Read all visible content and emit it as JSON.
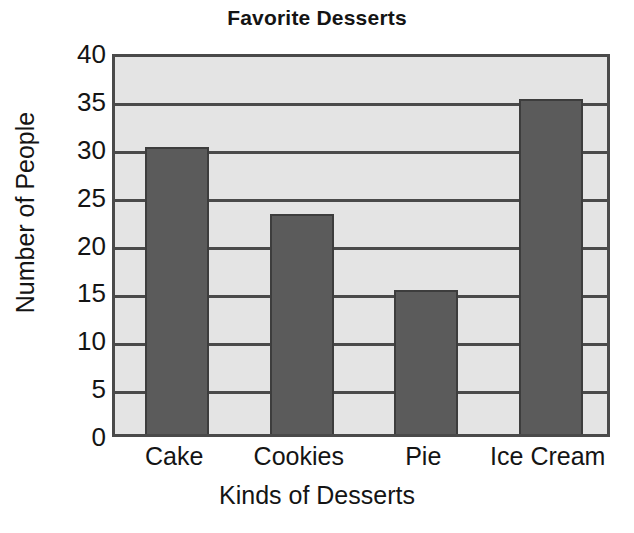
{
  "chart_data": {
    "type": "bar",
    "title": "Favorite Desserts",
    "xlabel": "Kinds of Desserts",
    "ylabel": "Number of People",
    "categories": [
      "Cake",
      "Cookies",
      "Pie",
      "Ice Cream"
    ],
    "values": [
      30,
      23,
      15,
      35
    ],
    "ylim": [
      0,
      40
    ],
    "ytick_labels": [
      "40",
      "35",
      "30",
      "25",
      "20",
      "15",
      "10",
      "5",
      "0"
    ],
    "ytick_values": [
      40,
      35,
      30,
      25,
      20,
      15,
      10,
      5,
      0
    ],
    "ytick_step": 5,
    "grid": "horizontal",
    "legend": "none",
    "bar_color": "#5b5b5b",
    "bar_edge_color": "#3d3d3d",
    "plot_background_color": "#e4e4e4",
    "axis_color": "#4a4a4a",
    "text_color": "#141414",
    "page_background_color": "#ffffff"
  }
}
